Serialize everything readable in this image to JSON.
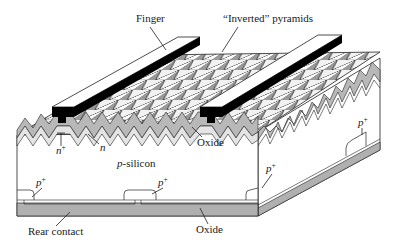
{
  "figure": {
    "type": "cross-section diagram"
  },
  "labels": {
    "finger": "Finger",
    "inverted_pyramids": "“Inverted” pyramids",
    "n_plus": "n",
    "n_plus_sup": "+",
    "n": "n",
    "p_silicon_italic": "p",
    "p_silicon_rest": "-silicon",
    "oxide_top": "Oxide",
    "p_plus_left": "p",
    "p_plus_mid": "p",
    "p_plus_front_right": "p",
    "p_plus_side": "p",
    "p_plus_sup": "+",
    "rear_contact": "Rear contact",
    "oxide_bottom": "Oxide"
  },
  "colors": {
    "finger_top": "#ffffff",
    "finger_side": "#000000",
    "oxide_layer": "#b8b8b8",
    "n_layer": "#d9d9d9",
    "rear_contact": "#b0b0b0",
    "silicon": "#ffffff",
    "outline": "#222222"
  }
}
